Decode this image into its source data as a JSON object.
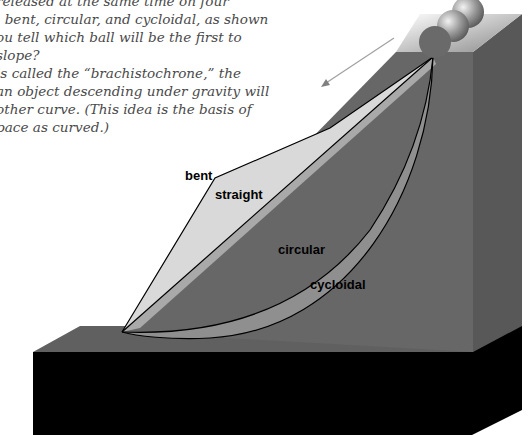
{
  "caption": {
    "lines": [
      "released at the same time on four",
      ", bent, circular, and cycloidal, as shown",
      "ou tell which ball will be the first to",
      " slope?",
      " is called the “brachistochrone,” the",
      "an object descending under gravity will",
      "other curve. (This idea is the basis of",
      "pace as curved.)"
    ]
  },
  "diagram": {
    "labels": {
      "bent": "bent",
      "straight": "straight",
      "circular": "circular",
      "cycloidal": "cycloidal"
    },
    "balls": 3,
    "arrow": "motion-direction-arrow",
    "colors": {
      "background": "#ffffff",
      "bent_face": "#d8d8d8",
      "straight_face": "#a8a8a8",
      "circular_face": "#6e6e6e",
      "cycloidal_face": "#8e8e8e",
      "tower_front": "#676767",
      "tower_side": "#595959",
      "slab_top": "#606060",
      "slab_front": "#000000",
      "outline": "#000000"
    }
  }
}
